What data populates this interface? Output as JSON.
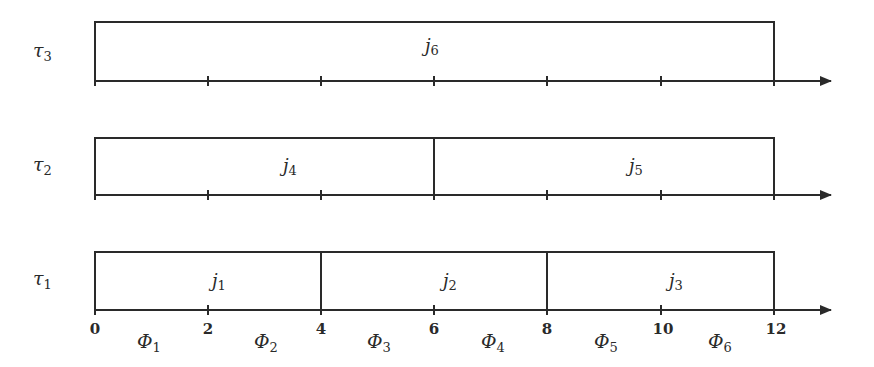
{
  "diagram": {
    "type": "timeline-schedule",
    "axis": {
      "ticks": [
        "0",
        "2",
        "4",
        "6",
        "8",
        "10",
        "12"
      ],
      "tick_values": [
        0,
        2,
        4,
        6,
        8,
        10,
        12
      ],
      "phases": [
        {
          "symbol": "Φ",
          "index": "1"
        },
        {
          "symbol": "Φ",
          "index": "2"
        },
        {
          "symbol": "Φ",
          "index": "3"
        },
        {
          "symbol": "Φ",
          "index": "4"
        },
        {
          "symbol": "Φ",
          "index": "5"
        },
        {
          "symbol": "Φ",
          "index": "6"
        }
      ]
    },
    "tasks": [
      {
        "symbol": "τ",
        "index": "3",
        "jobs": [
          {
            "symbol": "j",
            "index": "6",
            "start": 0,
            "end": 12
          }
        ]
      },
      {
        "symbol": "τ",
        "index": "2",
        "jobs": [
          {
            "symbol": "j",
            "index": "4",
            "start": 0,
            "end": 6
          },
          {
            "symbol": "j",
            "index": "5",
            "start": 6,
            "end": 12
          }
        ]
      },
      {
        "symbol": "τ",
        "index": "1",
        "jobs": [
          {
            "symbol": "j",
            "index": "1",
            "start": 0,
            "end": 4
          },
          {
            "symbol": "j",
            "index": "2",
            "start": 4,
            "end": 8
          },
          {
            "symbol": "j",
            "index": "3",
            "start": 8,
            "end": 12
          }
        ]
      }
    ],
    "colors": {
      "line": "#2a2a2a",
      "background": "#ffffff"
    }
  }
}
